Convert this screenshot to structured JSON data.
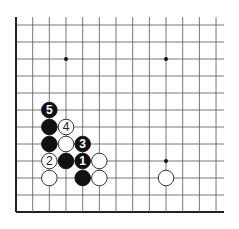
{
  "diagram": {
    "type": "go-board-corner",
    "board": {
      "origin_x": 16,
      "origin_y": 25,
      "spacing_x": 16.67,
      "spacing_y": 17.0,
      "columns": 13,
      "rows": 12,
      "right_extent": 224,
      "left_edge": true,
      "bottom_edge": true,
      "line_color": "#555555",
      "edge_color": "#222222"
    },
    "star_points": [
      {
        "col": 3,
        "row": 2
      },
      {
        "col": 9,
        "row": 2
      },
      {
        "col": 9,
        "row": 8
      }
    ],
    "stones": [
      {
        "col": 2,
        "row": 5,
        "color": "black",
        "label": "5"
      },
      {
        "col": 2,
        "row": 6,
        "color": "black",
        "label": ""
      },
      {
        "col": 3,
        "row": 6,
        "color": "white",
        "label": "4"
      },
      {
        "col": 2,
        "row": 7,
        "color": "black",
        "label": ""
      },
      {
        "col": 3,
        "row": 7,
        "color": "white",
        "label": ""
      },
      {
        "col": 4,
        "row": 7,
        "color": "black",
        "label": "3"
      },
      {
        "col": 2,
        "row": 8,
        "color": "white",
        "label": "2"
      },
      {
        "col": 3,
        "row": 8,
        "color": "black",
        "label": ""
      },
      {
        "col": 4,
        "row": 8,
        "color": "black",
        "label": "1"
      },
      {
        "col": 5,
        "row": 8,
        "color": "white",
        "label": ""
      },
      {
        "col": 2,
        "row": 9,
        "color": "white",
        "label": ""
      },
      {
        "col": 4,
        "row": 9,
        "color": "black",
        "label": ""
      },
      {
        "col": 5,
        "row": 9,
        "color": "white",
        "label": ""
      },
      {
        "col": 9,
        "row": 9,
        "color": "white",
        "label": ""
      }
    ],
    "colors": {
      "black_stone": "#111111",
      "white_stone": "#ffffff",
      "white_stroke": "#222222",
      "black_label": "#ffffff",
      "white_label": "#222222"
    }
  }
}
